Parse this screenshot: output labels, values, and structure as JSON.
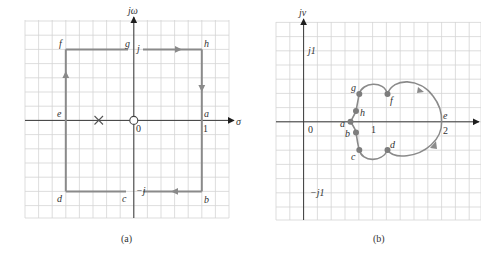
{
  "colors": {
    "grid": "#d4d4d4",
    "axis": "#3a3a3a",
    "contour": "#8a8a8a",
    "point": "#7d7d7d",
    "text": "#333333"
  },
  "panel_a": {
    "caption": "(a)",
    "axis_labels": {
      "vertical": "jω",
      "horizontal": "σ"
    },
    "tick_labels": {
      "origin": "0",
      "one": "1",
      "j": "j",
      "minus_j": "−j"
    },
    "contour_points": [
      "a",
      "b",
      "c",
      "d",
      "e",
      "f",
      "g",
      "h"
    ],
    "point_labels": {
      "a": "a",
      "b": "b",
      "c": "c",
      "d": "d",
      "e": "e",
      "f": "f",
      "g": "g",
      "h": "h"
    },
    "pole_marker": "×",
    "zero_marker": "○"
  },
  "panel_b": {
    "caption": "(b)",
    "axis_labels": {
      "vertical": "jv"
    },
    "tick_labels": {
      "origin": "0",
      "one": "1",
      "two": "2",
      "j1": "j1",
      "minus_j1": "−j1"
    },
    "point_labels": {
      "a": "a",
      "b": "b",
      "c": "c",
      "d": "d",
      "e": "e",
      "f": "f",
      "g": "g",
      "h": "h"
    }
  }
}
